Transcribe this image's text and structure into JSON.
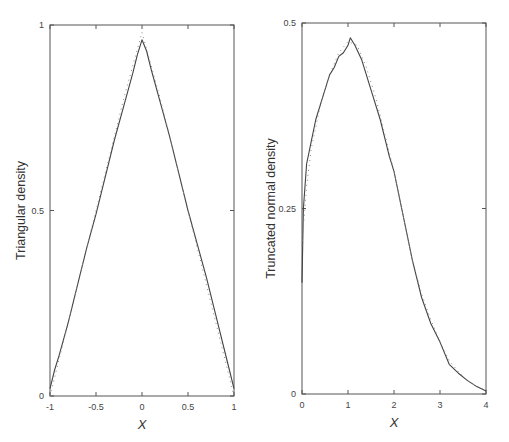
{
  "chart_data": [
    {
      "type": "line",
      "title": "",
      "xlabel": "X",
      "ylabel": "Triangular density",
      "xlim": [
        -1,
        1
      ],
      "ylim": [
        0,
        1
      ],
      "grid": false,
      "legend": null,
      "xticks": [
        -1,
        -0.5,
        0,
        0.5,
        1
      ],
      "xtick_labels": [
        "-1",
        "-0.5",
        "0",
        "0.5",
        "1"
      ],
      "yticks": [
        0,
        0.5,
        1
      ],
      "ytick_labels": [
        "0",
        "0.5",
        "1"
      ],
      "series": [
        {
          "name": "estimated density",
          "style": "solid",
          "x": [
            -1,
            -0.95,
            -0.9,
            -0.8,
            -0.7,
            -0.6,
            -0.5,
            -0.4,
            -0.3,
            -0.2,
            -0.1,
            -0.05,
            0,
            0.05,
            0.1,
            0.2,
            0.3,
            0.4,
            0.5,
            0.6,
            0.7,
            0.8,
            0.9,
            0.95,
            1
          ],
          "y": [
            0.02,
            0.07,
            0.11,
            0.2,
            0.3,
            0.4,
            0.49,
            0.59,
            0.69,
            0.78,
            0.87,
            0.92,
            0.96,
            0.93,
            0.88,
            0.79,
            0.7,
            0.6,
            0.5,
            0.41,
            0.32,
            0.22,
            0.12,
            0.07,
            0.02
          ]
        },
        {
          "name": "true density",
          "style": "dotted",
          "x": [
            -1,
            -0.8,
            -0.6,
            -0.4,
            -0.2,
            0,
            0.2,
            0.4,
            0.6,
            0.8,
            1
          ],
          "y": [
            0.0,
            0.2,
            0.4,
            0.6,
            0.8,
            0.98,
            0.8,
            0.6,
            0.4,
            0.2,
            0.0
          ]
        }
      ]
    },
    {
      "type": "line",
      "title": "",
      "xlabel": "X",
      "ylabel": "Truncated normal density",
      "xlim": [
        0,
        4
      ],
      "ylim": [
        0,
        0.5
      ],
      "grid": false,
      "legend": null,
      "xticks": [
        0,
        1,
        2,
        3,
        4
      ],
      "xtick_labels": [
        "0",
        "1",
        "2",
        "3",
        "4"
      ],
      "yticks": [
        0,
        0.25,
        0.5
      ],
      "ytick_labels": [
        "0",
        "0.25",
        "0.5"
      ],
      "series": [
        {
          "name": "estimated density",
          "style": "solid",
          "x": [
            0,
            0.03,
            0.1,
            0.2,
            0.3,
            0.45,
            0.6,
            0.7,
            0.8,
            0.9,
            1.0,
            1.05,
            1.15,
            1.3,
            1.5,
            1.7,
            1.9,
            2.0,
            2.2,
            2.4,
            2.6,
            2.8,
            3.0,
            3.2,
            3.4,
            3.6,
            3.8,
            4.0
          ],
          "y": [
            0.15,
            0.25,
            0.31,
            0.34,
            0.37,
            0.4,
            0.43,
            0.44,
            0.455,
            0.46,
            0.47,
            0.48,
            0.47,
            0.45,
            0.41,
            0.37,
            0.32,
            0.3,
            0.24,
            0.18,
            0.13,
            0.095,
            0.07,
            0.04,
            0.028,
            0.018,
            0.01,
            0.004
          ]
        },
        {
          "name": "true density",
          "style": "dotted",
          "x": [
            0,
            0.1,
            0.2,
            0.4,
            0.6,
            0.8,
            1.0,
            1.2,
            1.4,
            1.6,
            1.8,
            2.0,
            2.2,
            2.4,
            2.6,
            2.8,
            3.0,
            3.2,
            3.4,
            3.6,
            3.8,
            4.0
          ],
          "y": [
            0.2,
            0.28,
            0.33,
            0.39,
            0.43,
            0.46,
            0.475,
            0.47,
            0.44,
            0.4,
            0.35,
            0.3,
            0.24,
            0.18,
            0.135,
            0.1,
            0.07,
            0.045,
            0.03,
            0.018,
            0.01,
            0.005
          ]
        }
      ]
    }
  ]
}
